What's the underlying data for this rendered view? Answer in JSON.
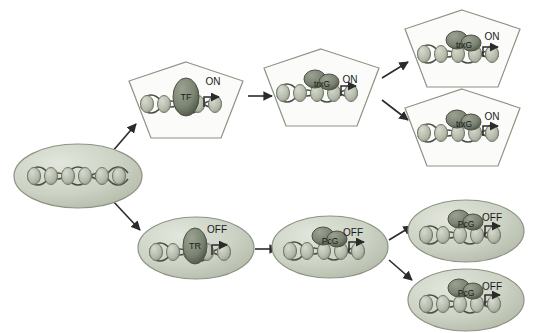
{
  "figure": {
    "background": "#ffffff"
  },
  "colors": {
    "cell_fill": "#cfd4c8",
    "cell_stroke": "#8d9383",
    "nucleosome_fill": "#b9bfb1",
    "nucleosome_stroke": "#6f7566",
    "dna_stroke": "#4a4f45",
    "protein_fill": "#7e8576",
    "protein_stroke": "#4c5144",
    "arrow": "#2b2b2b",
    "text": "#1a1a1a"
  },
  "nodes": [
    {
      "id": "origin",
      "shape": "ellipse",
      "label": "",
      "state_label": "",
      "factor_label": "",
      "cx": 78,
      "cy": 176,
      "rx": 64,
      "ry": 32
    },
    {
      "id": "on-1",
      "shape": "pentagon",
      "label": "",
      "state_label": "ON",
      "factor_label": "TF",
      "cx": 186,
      "cy": 100,
      "rx": 57,
      "ry": 38
    },
    {
      "id": "on-2",
      "shape": "pentagon",
      "label": "",
      "state_label": "ON",
      "factor_label": "trxG",
      "cx": 321,
      "cy": 87,
      "rx": 57,
      "ry": 38
    },
    {
      "id": "on-3a",
      "shape": "pentagon",
      "label": "",
      "state_label": "ON",
      "factor_label": "trxG",
      "cx": 462,
      "cy": 48,
      "rx": 57,
      "ry": 38
    },
    {
      "id": "on-3b",
      "shape": "pentagon",
      "label": "",
      "state_label": "ON",
      "factor_label": "trxG",
      "cx": 462,
      "cy": 127,
      "rx": 57,
      "ry": 38
    },
    {
      "id": "off-1",
      "shape": "ellipse",
      "label": "",
      "state_label": "OFF",
      "factor_label": "TR",
      "cx": 196,
      "cy": 248,
      "rx": 58,
      "ry": 32
    },
    {
      "id": "off-2",
      "shape": "ellipse",
      "label": "",
      "state_label": "OFF",
      "factor_label": "PcG",
      "cx": 330,
      "cy": 247,
      "rx": 58,
      "ry": 32
    },
    {
      "id": "off-3a",
      "shape": "ellipse",
      "label": "",
      "state_label": "OFF",
      "factor_label": "PcG",
      "cx": 466,
      "cy": 231,
      "rx": 58,
      "ry": 32
    },
    {
      "id": "off-3b",
      "shape": "ellipse",
      "label": "",
      "state_label": "OFF",
      "factor_label": "PcG",
      "cx": 466,
      "cy": 300,
      "rx": 58,
      "ry": 32
    }
  ],
  "labels": {
    "on": "ON",
    "off": "OFF",
    "tf": "TF",
    "tr": "TR",
    "trxg": "trxG",
    "pcg": "PcG"
  },
  "arrows": [
    {
      "id": "origin-to-on1",
      "from": "origin",
      "to": "on-1",
      "x1": 112,
      "y1": 152,
      "x2": 136,
      "y2": 124
    },
    {
      "id": "origin-to-off1",
      "from": "origin",
      "to": "off-1",
      "x1": 112,
      "y1": 200,
      "x2": 140,
      "y2": 230
    },
    {
      "id": "on1-to-on2",
      "from": "on-1",
      "to": "on-2",
      "x1": 248,
      "y1": 96,
      "x2": 272,
      "y2": 96
    },
    {
      "id": "on2-to-on3a",
      "from": "on-2",
      "to": "on-3a",
      "x1": 382,
      "y1": 78,
      "x2": 408,
      "y2": 62
    },
    {
      "id": "on2-to-on3b",
      "from": "on-2",
      "to": "on-3b",
      "x1": 382,
      "y1": 100,
      "x2": 408,
      "y2": 120
    },
    {
      "id": "off1-to-off2",
      "from": "off-1",
      "to": "off-2",
      "x1": 255,
      "y1": 249,
      "x2": 278,
      "y2": 249
    },
    {
      "id": "off2-to-off3a",
      "from": "off-2",
      "to": "off-3a",
      "x1": 389,
      "y1": 240,
      "x2": 412,
      "y2": 226
    },
    {
      "id": "off2-to-off3b",
      "from": "off-2",
      "to": "off-3b",
      "x1": 389,
      "y1": 260,
      "x2": 412,
      "y2": 280
    }
  ],
  "state_label_positions": [
    {
      "id": "on-1-state",
      "text": "ON",
      "x": 213,
      "y": 83
    },
    {
      "id": "on-2-state",
      "text": "ON",
      "x": 350,
      "y": 81
    },
    {
      "id": "on-3a-state",
      "text": "ON",
      "x": 492,
      "y": 38
    },
    {
      "id": "on-3b-state",
      "text": "ON",
      "x": 492,
      "y": 118
    },
    {
      "id": "off-1-state",
      "text": "OFF",
      "x": 216,
      "y": 231
    },
    {
      "id": "off-2-state",
      "text": "OFF",
      "x": 352,
      "y": 234
    },
    {
      "id": "off-3a-state",
      "text": "OFF",
      "x": 492,
      "y": 219
    },
    {
      "id": "off-3b-state",
      "text": "OFF",
      "x": 492,
      "y": 288
    }
  ],
  "factor_label_positions": [
    {
      "id": "on-1-factor",
      "text": "TF",
      "x": 186,
      "y": 95
    },
    {
      "id": "on-2-factor",
      "text": "trxG",
      "x": 322,
      "y": 85
    },
    {
      "id": "on-3a-factor",
      "text": "trxG",
      "x": 464,
      "y": 46
    },
    {
      "id": "on-3b-factor",
      "text": "trxG",
      "x": 464,
      "y": 125
    },
    {
      "id": "off-1-factor",
      "text": "TR",
      "x": 195,
      "y": 246
    },
    {
      "id": "off-2-factor",
      "text": "PcG",
      "x": 330,
      "y": 241
    },
    {
      "id": "off-3a-factor",
      "text": "PcG",
      "x": 466,
      "y": 224
    },
    {
      "id": "off-3b-factor",
      "text": "PcG",
      "x": 466,
      "y": 293
    }
  ]
}
